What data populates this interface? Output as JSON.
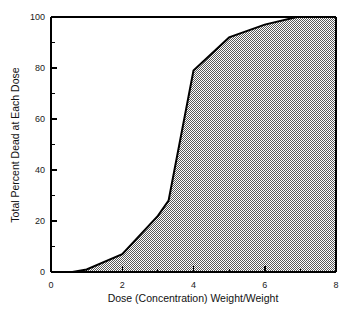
{
  "chart_data": {
    "type": "area",
    "title": "",
    "xlabel": "Dose (Concentration) Weight/Weight",
    "ylabel": "Total Percent Dead at Each Dose",
    "xlim": [
      0,
      8
    ],
    "ylim": [
      0,
      100
    ],
    "grid": false,
    "legend": "none",
    "fill_style": "50% gray dither pattern",
    "line_color": "#000000",
    "fill_color": "#999999",
    "background_color": "#ffffff",
    "xticks": [
      0,
      2,
      4,
      6,
      8
    ],
    "xtick_labels": [
      "0",
      "2",
      "4",
      "6",
      "8"
    ],
    "x_minor_ticks": [
      1,
      3,
      5,
      7
    ],
    "yticks": [
      0,
      20,
      40,
      60,
      80,
      100
    ],
    "ytick_labels": [
      "0",
      "20",
      "40",
      "60",
      "80",
      "100"
    ],
    "y_minor_ticks": [
      10,
      30,
      50,
      70,
      90
    ],
    "series": [
      {
        "name": "Cumulative mortality",
        "x": [
          0,
          0.6,
          1.0,
          2.0,
          3.0,
          3.3,
          4.0,
          5.0,
          6.0,
          6.9,
          8.0
        ],
        "values": [
          0,
          0,
          1,
          7,
          22,
          28,
          79,
          92,
          97,
          100,
          100
        ]
      }
    ]
  }
}
